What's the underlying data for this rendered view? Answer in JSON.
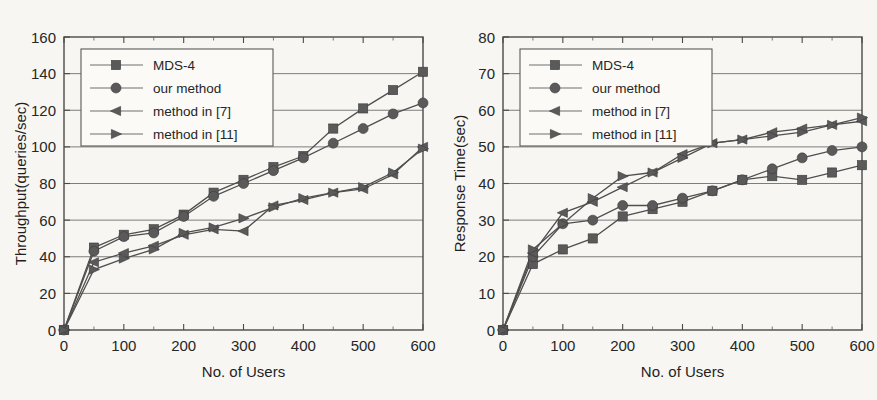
{
  "figure": {
    "background_color": "#f7f6f2",
    "ink_color": "#4f4f4f",
    "marker_color": "#5a5a5a"
  },
  "legend": {
    "position": "top-left-inside",
    "entries": [
      {
        "label": "MDS-4",
        "marker": "square-marker"
      },
      {
        "label": "our method",
        "marker": "circle-marker"
      },
      {
        "label": "method in [7]",
        "marker": "left-triangle-marker"
      },
      {
        "label": "method in [11]",
        "marker": "right-triangle-marker"
      }
    ]
  },
  "chart_data": [
    {
      "type": "line",
      "title": "",
      "xlabel": "No. of Users",
      "ylabel": "Throughput(queries/sec)",
      "xlim": [
        0,
        600
      ],
      "ylim": [
        0,
        160
      ],
      "xticks": [
        0,
        100,
        200,
        300,
        400,
        500,
        600
      ],
      "yticks": [
        0,
        20,
        40,
        60,
        80,
        100,
        120,
        140,
        160
      ],
      "xtick_labels": [
        "0",
        "100",
        "200",
        "300",
        "400",
        "500",
        "600"
      ],
      "ytick_labels": [
        "0",
        "20",
        "40",
        "60",
        "80",
        "100",
        "120",
        "140",
        "160"
      ],
      "grid": true,
      "legend": true,
      "x": [
        0,
        50,
        100,
        150,
        200,
        250,
        300,
        350,
        400,
        450,
        500,
        550,
        600
      ],
      "series": [
        {
          "name": "MDS-4",
          "marker": "square-marker",
          "values": [
            0,
            45,
            52,
            55,
            63,
            75,
            82,
            89,
            95,
            110,
            121,
            131,
            141
          ]
        },
        {
          "name": "our method",
          "marker": "circle-marker",
          "values": [
            0,
            43,
            51,
            53,
            62,
            73,
            80,
            87,
            94,
            102,
            110,
            118,
            124
          ]
        },
        {
          "name": "method in [7]",
          "marker": "left-triangle-marker",
          "values": [
            0,
            37,
            42,
            46,
            52,
            55,
            54,
            68,
            71,
            75,
            77,
            85,
            100
          ]
        },
        {
          "name": "method in [11]",
          "marker": "right-triangle-marker",
          "values": [
            0,
            33,
            39,
            44,
            53,
            56,
            61,
            67,
            72,
            75,
            78,
            86,
            99
          ]
        }
      ]
    },
    {
      "type": "line",
      "title": "",
      "xlabel": "No. of Users",
      "ylabel": "Response Time(sec)",
      "xlim": [
        0,
        600
      ],
      "ylim": [
        0,
        80
      ],
      "xticks": [
        0,
        100,
        200,
        300,
        400,
        500,
        600
      ],
      "yticks": [
        0,
        10,
        20,
        30,
        40,
        50,
        60,
        70,
        80
      ],
      "xtick_labels": [
        "0",
        "100",
        "200",
        "300",
        "400",
        "500",
        "600"
      ],
      "ytick_labels": [
        "0",
        "10",
        "20",
        "30",
        "40",
        "50",
        "60",
        "70",
        "80"
      ],
      "grid": true,
      "legend": true,
      "x": [
        0,
        50,
        100,
        150,
        200,
        250,
        300,
        350,
        400,
        450,
        500,
        550,
        600
      ],
      "series": [
        {
          "name": "MDS-4",
          "marker": "square-marker",
          "values": [
            0,
            18,
            22,
            25,
            31,
            33,
            35,
            38,
            41,
            42,
            41,
            43,
            45
          ]
        },
        {
          "name": "our method",
          "marker": "circle-marker",
          "values": [
            0,
            20,
            29,
            30,
            34,
            34,
            36,
            38,
            41,
            44,
            47,
            49,
            50
          ]
        },
        {
          "name": "method in [7]",
          "marker": "left-triangle-marker",
          "values": [
            0,
            21,
            32,
            35,
            39,
            43,
            48,
            51,
            52,
            54,
            55,
            56,
            57
          ]
        },
        {
          "name": "method in [11]",
          "marker": "right-triangle-marker",
          "values": [
            0,
            22,
            29,
            36,
            42,
            43,
            47,
            51,
            52,
            53,
            54,
            56,
            58
          ]
        }
      ]
    }
  ]
}
